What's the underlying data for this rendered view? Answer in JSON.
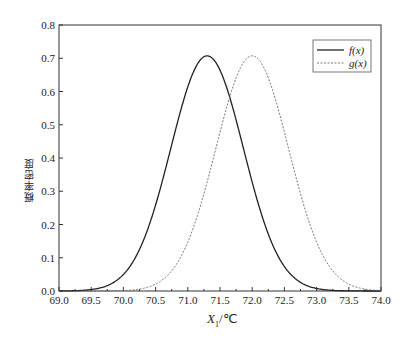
{
  "chart_data": {
    "type": "line",
    "title": "",
    "xlabel": "X1/℃",
    "xlabel_main": "X",
    "xlabel_sub": "1",
    "xlabel_unit": "/℃",
    "ylabel": "概率密度",
    "xlim": [
      69.0,
      74.0
    ],
    "ylim": [
      0.0,
      0.8
    ],
    "xticks": [
      "69.0",
      "69.5",
      "70.0",
      "70.5",
      "71.0",
      "71.5",
      "72.0",
      "72.5",
      "73.0",
      "73.5",
      "74.0"
    ],
    "yticks": [
      "0.0",
      "0.1",
      "0.2",
      "0.3",
      "0.4",
      "0.5",
      "0.6",
      "0.7",
      "0.8"
    ],
    "grid": false,
    "legend_position": "upper right",
    "series": [
      {
        "name": "f(x)",
        "style": "solid",
        "distribution": "normal",
        "mean": 71.3,
        "std": 0.564,
        "peak": 0.707
      },
      {
        "name": "g(x)",
        "style": "dashed",
        "distribution": "normal",
        "mean": 72.0,
        "std": 0.564,
        "peak": 0.707
      }
    ]
  }
}
